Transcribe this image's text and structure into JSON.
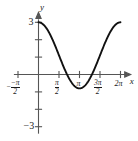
{
  "figure": {
    "axis_labels": {
      "x": "x",
      "y": "y"
    },
    "y_ticks": [
      {
        "value": 3,
        "label": "3"
      },
      {
        "value": -3,
        "label": "−3"
      }
    ],
    "x_ticks": [
      {
        "value": -1.5707963,
        "label": "−π/2",
        "num": "−π",
        "den": "2",
        "sign": "−"
      },
      {
        "value": 1.5707963,
        "label": "π/2",
        "num": "π",
        "den": "2",
        "sign": ""
      },
      {
        "value": 3.1415927,
        "label": "π",
        "num": "π",
        "den": "",
        "sign": ""
      },
      {
        "value": 4.712389,
        "label": "3π/2",
        "num": "3π",
        "den": "2",
        "sign": ""
      },
      {
        "value": 6.2831853,
        "label": "2π",
        "num": "2π",
        "den": "",
        "sign": ""
      }
    ],
    "colors": {
      "curve": "#111111",
      "axis": "#555555",
      "background": "#ffffff"
    }
  },
  "chart_data": {
    "type": "line",
    "title": "",
    "xlabel": "x",
    "ylabel": "y",
    "xlim": [
      -1.8849556,
      6.9115038
    ],
    "ylim": [
      -3.4,
      3.4
    ],
    "grid": false,
    "legend": null,
    "xtick_values": [
      -1.5707963,
      1.5707963,
      3.1415927,
      4.712389,
      6.2831853
    ],
    "xtick_labels": [
      "−π/2",
      "π/2",
      "π",
      "3π/2",
      "2π"
    ],
    "ytick_values": [
      -3,
      -2,
      -1,
      1,
      2,
      3
    ],
    "ytick_labels": [
      "−3",
      "",
      "",
      "",
      "",
      "3"
    ],
    "equation": "y = 1.1 + 1.9*cos(x)",
    "series": [
      {
        "name": "y = 1.1 + 1.9 cos(x)",
        "x": [
          0.0,
          0.31,
          0.63,
          0.94,
          1.26,
          1.57,
          1.88,
          2.2,
          2.51,
          2.83,
          3.14,
          3.46,
          3.77,
          4.08,
          4.4,
          4.71,
          5.03,
          5.34,
          5.65,
          5.97,
          6.28
        ],
        "values": [
          3.0,
          2.91,
          2.64,
          2.22,
          1.69,
          1.1,
          0.51,
          -0.02,
          -0.44,
          -0.71,
          -0.8,
          -0.71,
          -0.44,
          -0.02,
          0.51,
          1.1,
          1.69,
          2.22,
          2.64,
          2.91,
          3.0
        ]
      }
    ],
    "annotations": [
      {
        "text": "maximum",
        "x": 0.0,
        "y": 3.0
      },
      {
        "text": "minimum",
        "x": 3.1415927,
        "y": -0.8
      },
      {
        "text": "maximum",
        "x": 6.2831853,
        "y": 3.0
      }
    ]
  }
}
